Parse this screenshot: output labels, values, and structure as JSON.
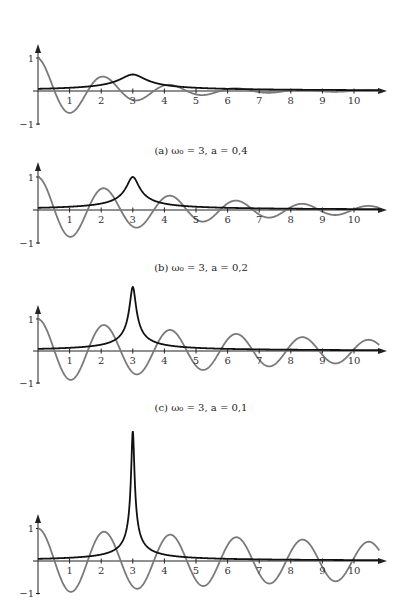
{
  "figure": {
    "x_axis": {
      "origin_px": 38,
      "px_per_unit": 31.6,
      "end_px": 387,
      "tick_labels": [
        "1",
        "2",
        "3",
        "4",
        "5",
        "6",
        "7",
        "8",
        "9",
        "10"
      ]
    },
    "y_axis": {
      "tick_labels": [
        "1",
        "−1"
      ]
    },
    "colors": {
      "signal": "#7a7a7a",
      "spectrum": "#111111",
      "axis": "#222222"
    }
  },
  "chart_data": [
    {
      "type": "line",
      "title": "",
      "caption": "(a) ω₀ = 3,  a = 0,4",
      "omega0": 3,
      "a": 0.4,
      "xlabel": "",
      "ylabel": "",
      "xlim": [
        0,
        10.8
      ],
      "ylim": [
        -1,
        1
      ],
      "x_ticks": [
        1,
        2,
        3,
        4,
        5,
        6,
        7,
        8,
        9,
        10
      ],
      "y_ticks": [
        -1,
        1
      ],
      "grid": false,
      "series": [
        {
          "name": "signal",
          "formula": "cos(ω₀·t)·exp(−a·t)",
          "color": "gray",
          "x": [
            0,
            0.5,
            1,
            1.5,
            2,
            2.5,
            3,
            3.5,
            4,
            5,
            6,
            7,
            8,
            9,
            10
          ],
          "values": [
            1,
            0.06,
            -0.66,
            -0.11,
            0.43,
            0.13,
            -0.27,
            -0.12,
            0.17,
            -0.1,
            0.06,
            -0.03,
            0.02,
            -0.01,
            0.01
          ]
        },
        {
          "name": "spectrum",
          "formula": "0.2/√(a²+(t−ω₀)²)",
          "color": "black",
          "x": [
            0,
            1,
            2,
            2.5,
            3,
            3.5,
            4,
            5,
            6,
            8,
            10
          ],
          "values": [
            0.07,
            0.1,
            0.19,
            0.31,
            0.5,
            0.31,
            0.19,
            0.1,
            0.07,
            0.04,
            0.03
          ]
        }
      ]
    },
    {
      "type": "line",
      "title": "",
      "caption": "(b) ω₀ = 3,  a = 0,2",
      "omega0": 3,
      "a": 0.2,
      "xlim": [
        0,
        10.8
      ],
      "ylim": [
        -1,
        1
      ],
      "x_ticks": [
        1,
        2,
        3,
        4,
        5,
        6,
        7,
        8,
        9,
        10
      ],
      "y_ticks": [
        -1,
        1
      ],
      "grid": false,
      "series": [
        {
          "name": "signal",
          "formula": "cos(ω₀·t)·exp(−a·t)",
          "color": "gray",
          "x": [
            0,
            1.05,
            2.09,
            3.14,
            4.19,
            5.24,
            6.28,
            7.33,
            8.38,
            9.42,
            10.47
          ],
          "values": [
            1,
            -0.81,
            0.66,
            -0.53,
            0.43,
            -0.35,
            0.28,
            -0.23,
            0.19,
            -0.15,
            0.12
          ]
        },
        {
          "name": "spectrum",
          "formula": "0.2/√(a²+(t−ω₀)²)",
          "color": "black",
          "x": [
            0,
            1,
            2,
            2.5,
            3,
            3.5,
            4,
            5,
            6,
            8,
            10
          ],
          "values": [
            0.07,
            0.1,
            0.2,
            0.37,
            1.0,
            0.37,
            0.2,
            0.1,
            0.07,
            0.04,
            0.03
          ]
        }
      ]
    },
    {
      "type": "line",
      "title": "",
      "caption": "(c) ω₀ = 3,  a = 0,1",
      "omega0": 3,
      "a": 0.1,
      "xlim": [
        0,
        10.8
      ],
      "ylim": [
        -1,
        2
      ],
      "x_ticks": [
        1,
        2,
        3,
        4,
        5,
        6,
        7,
        8,
        9,
        10
      ],
      "y_ticks": [
        -1,
        1
      ],
      "grid": false,
      "series": [
        {
          "name": "signal",
          "formula": "cos(ω₀·t)·exp(−a·t)",
          "color": "gray",
          "x": [
            0,
            1.05,
            2.09,
            3.14,
            4.19,
            5.24,
            6.28,
            7.33,
            8.38,
            9.42,
            10.47
          ],
          "values": [
            1,
            -0.9,
            0.81,
            -0.73,
            0.66,
            -0.59,
            0.53,
            -0.48,
            0.43,
            -0.39,
            0.35
          ]
        },
        {
          "name": "spectrum",
          "formula": "0.2/√(a²+(t−ω₀)²)",
          "color": "black",
          "x": [
            0,
            1,
            2,
            2.5,
            3,
            3.5,
            4,
            5,
            6,
            8,
            10
          ],
          "values": [
            0.07,
            0.1,
            0.2,
            0.39,
            2.0,
            0.39,
            0.2,
            0.1,
            0.07,
            0.04,
            0.03
          ]
        }
      ]
    },
    {
      "type": "line",
      "title": "",
      "caption": "",
      "omega0": 3,
      "a": 0.05,
      "xlim": [
        0,
        10.8
      ],
      "ylim": [
        -1,
        4
      ],
      "x_ticks": [
        1,
        2,
        3,
        4,
        5,
        6,
        7,
        8,
        9,
        10
      ],
      "y_ticks": [
        -1,
        1
      ],
      "grid": false,
      "series": [
        {
          "name": "signal",
          "formula": "cos(ω₀·t)·exp(−a·t)",
          "color": "gray",
          "x": [
            0,
            1.05,
            2.09,
            3.14,
            4.19,
            5.24,
            6.28,
            7.33,
            8.38,
            9.42,
            10.47
          ],
          "values": [
            1,
            -0.95,
            0.9,
            -0.85,
            0.81,
            -0.77,
            0.73,
            -0.69,
            0.66,
            -0.62,
            0.59
          ]
        },
        {
          "name": "spectrum",
          "formula": "0.2/√(a²+(t−ω₀)²)",
          "color": "black",
          "x": [
            0,
            1,
            2,
            2.5,
            3,
            3.5,
            4,
            5,
            6,
            8,
            10
          ],
          "values": [
            0.07,
            0.1,
            0.2,
            0.39,
            4.0,
            0.39,
            0.2,
            0.1,
            0.07,
            0.04,
            0.03
          ]
        }
      ]
    }
  ],
  "layout": {
    "panels": [
      {
        "origin_y": 91,
        "unit": 33,
        "arrow_top": 44,
        "caption_y": 154
      },
      {
        "origin_y": 210,
        "unit": 33,
        "arrow_top": 162,
        "caption_y": 271
      },
      {
        "origin_y": 351,
        "unit": 32,
        "arrow_top": 305,
        "caption_y": 411
      },
      {
        "origin_y": 561,
        "unit": 32.5,
        "arrow_top": 514,
        "caption_y": null
      }
    ]
  }
}
